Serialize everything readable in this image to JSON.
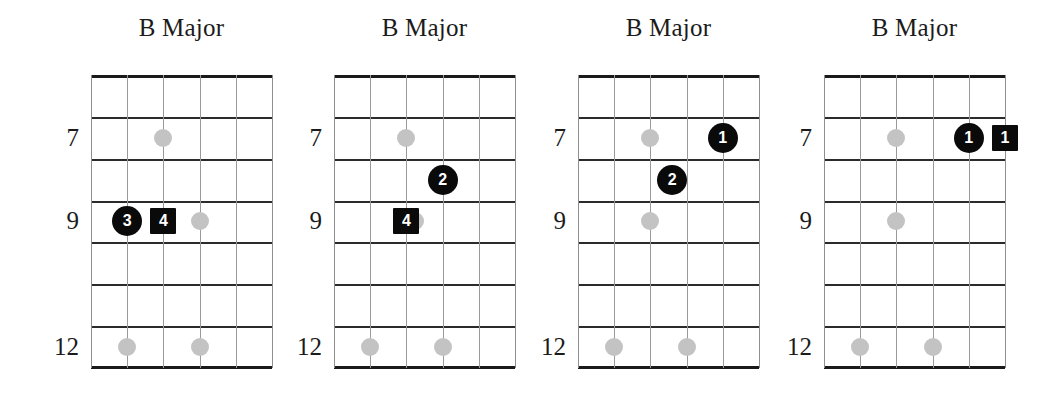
{
  "page": {
    "width": 1063,
    "height": 397,
    "background": "#ffffff",
    "ink_color": "#1b1b1b",
    "ghost_dot_color": "#c3c3c3",
    "marker_color": "#0a0a0a",
    "marker_text_color": "#ffffff",
    "fret_line_color": "#2b2b2b",
    "string_line_color": "#9a9a9a"
  },
  "chart_data": {
    "type": "diagram",
    "subtype": "guitar-chord-chart",
    "strings": 6,
    "frets": 7,
    "diagrams": [
      {
        "index": 1,
        "title": "B Major",
        "fret_labels": [
          {
            "text": "7",
            "row": 2
          },
          {
            "text": "9",
            "row": 4
          },
          {
            "text": "12",
            "row": 7
          }
        ],
        "ghost_dots": [
          {
            "string": 3,
            "row": 2
          },
          {
            "string": 4,
            "row": 4
          },
          {
            "string": 2,
            "row": 7
          },
          {
            "string": 4,
            "row": 7
          }
        ],
        "fingers": [
          {
            "label": "3",
            "shape": "circle",
            "string": 2,
            "row": 4
          },
          {
            "label": "4",
            "shape": "square",
            "string": 3,
            "row": 4
          }
        ]
      },
      {
        "index": 2,
        "title": "B Major",
        "fret_labels": [
          {
            "text": "7",
            "row": 2
          },
          {
            "text": "9",
            "row": 4
          },
          {
            "text": "12",
            "row": 7
          }
        ],
        "ghost_dots": [
          {
            "string": 3,
            "row": 2
          },
          {
            "string": 3.25,
            "row": 4
          },
          {
            "string": 2,
            "row": 7
          },
          {
            "string": 4,
            "row": 7
          }
        ],
        "fingers": [
          {
            "label": "2",
            "shape": "circle",
            "string": 4,
            "row": 3
          },
          {
            "label": "4",
            "shape": "square",
            "string": 3,
            "row": 4
          }
        ]
      },
      {
        "index": 3,
        "title": "B Major",
        "fret_labels": [
          {
            "text": "7",
            "row": 2
          },
          {
            "text": "9",
            "row": 4
          },
          {
            "text": "12",
            "row": 7
          }
        ],
        "ghost_dots": [
          {
            "string": 3,
            "row": 2
          },
          {
            "string": 3,
            "row": 4
          },
          {
            "string": 2,
            "row": 7
          },
          {
            "string": 4,
            "row": 7
          }
        ],
        "fingers": [
          {
            "label": "1",
            "shape": "circle",
            "string": 5,
            "row": 2
          },
          {
            "label": "2",
            "shape": "circle",
            "string": 3.6,
            "row": 3
          }
        ]
      },
      {
        "index": 4,
        "title": "B Major",
        "fret_labels": [
          {
            "text": "7",
            "row": 2
          },
          {
            "text": "9",
            "row": 4
          },
          {
            "text": "12",
            "row": 7
          }
        ],
        "ghost_dots": [
          {
            "string": 3,
            "row": 2
          },
          {
            "string": 3,
            "row": 4
          },
          {
            "string": 2,
            "row": 7
          },
          {
            "string": 4,
            "row": 7
          }
        ],
        "fingers": [
          {
            "label": "1",
            "shape": "circle",
            "string": 5,
            "row": 2
          },
          {
            "label": "1",
            "shape": "square",
            "string": 6,
            "row": 2
          }
        ]
      }
    ]
  },
  "geometry": {
    "board_top": 75,
    "board_height": 293,
    "row_height": 41.857,
    "boards": [
      {
        "left": 91,
        "width": 181,
        "panel_left": 0,
        "panel_width": 310
      },
      {
        "left": 334,
        "width": 181,
        "panel_left": 0,
        "panel_width": 310
      },
      {
        "left": 578,
        "width": 181,
        "panel_left": 0,
        "panel_width": 310
      },
      {
        "left": 824,
        "width": 181,
        "panel_left": 0,
        "panel_width": 310
      }
    ],
    "dot_size": 18,
    "finger_circle_size": 30,
    "finger_square_size": 26,
    "finger_font_size": 16,
    "title_font_size": 25,
    "fret_label_font_size": 25,
    "fret_label_gap": 12
  }
}
